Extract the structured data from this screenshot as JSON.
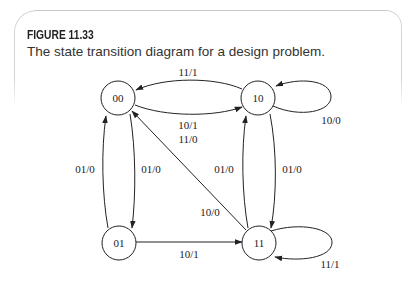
{
  "figure": {
    "label": "FIGURE 11.33",
    "caption": "The state transition diagram for a design problem."
  },
  "diagram": {
    "type": "state-transition-diagram",
    "states": [
      {
        "id": "00",
        "label": "00",
        "cx": 118,
        "cy": 98
      },
      {
        "id": "10",
        "label": "10",
        "cx": 258,
        "cy": 98
      },
      {
        "id": "01",
        "label": "01",
        "cx": 119,
        "cy": 243
      },
      {
        "id": "11",
        "label": "11",
        "cx": 259,
        "cy": 243
      }
    ],
    "transitions": [
      {
        "from": "10",
        "to": "00",
        "labels": [
          "11/1"
        ]
      },
      {
        "from": "00",
        "to": "10",
        "labels": [
          "10/1",
          "11/0"
        ]
      },
      {
        "from": "10",
        "to": "10",
        "labels": [
          "10/0"
        ]
      },
      {
        "from": "01",
        "to": "00",
        "labels": [
          "01/0"
        ]
      },
      {
        "from": "00",
        "to": "01",
        "labels": [
          "01/0"
        ]
      },
      {
        "from": "11",
        "to": "10",
        "labels": [
          "01/0"
        ]
      },
      {
        "from": "10",
        "to": "11",
        "labels": [
          "01/0"
        ]
      },
      {
        "from": "11",
        "to": "00",
        "labels": [
          "10/0"
        ]
      },
      {
        "from": "01",
        "to": "11",
        "labels": [
          "10/1"
        ]
      },
      {
        "from": "11",
        "to": "11",
        "labels": [
          "11/1"
        ]
      }
    ],
    "edge_labels": {
      "e10_00": "11/1",
      "e00_10_a": "10/1",
      "e00_10_b": "11/0",
      "e10_10": "10/0",
      "e01_00": "01/0",
      "e00_01": "01/0",
      "e11_10": "01/0",
      "e10_11": "01/0",
      "e11_00": "10/0",
      "e01_11": "10/1",
      "e11_11": "11/1"
    }
  },
  "colors": {
    "ink": "#222222",
    "frame": "#c8c8c8",
    "background": "#ffffff"
  }
}
